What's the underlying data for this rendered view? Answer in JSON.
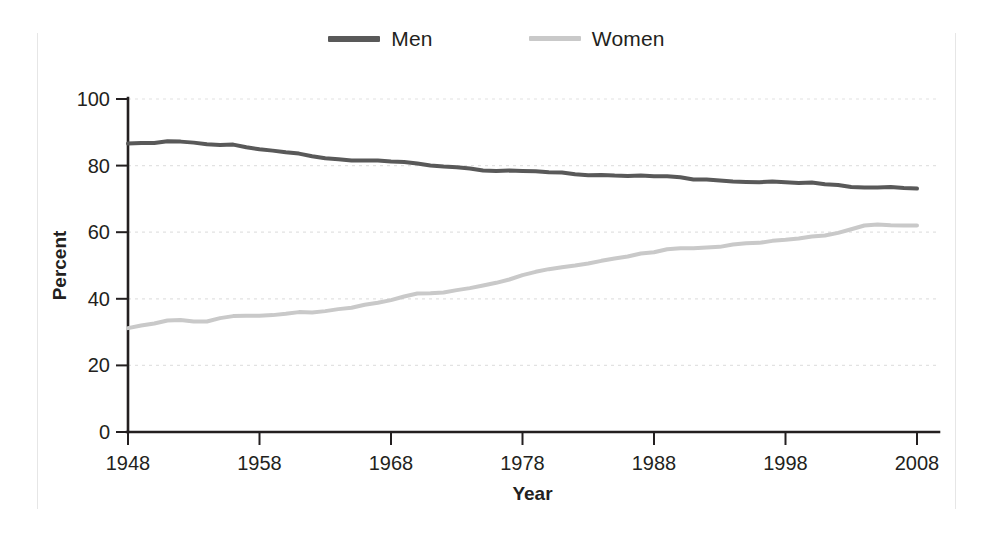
{
  "legend": {
    "position": "top-center",
    "entries": [
      {
        "label": "Men",
        "color": "#595959",
        "swatch": "men-line-swatch"
      },
      {
        "label": "Women",
        "color": "#c9c9c9",
        "swatch": "women-line-swatch"
      }
    ]
  },
  "chart_data": {
    "type": "line",
    "title": "",
    "subtitle": "",
    "xlabel": "Year",
    "ylabel": "Percent",
    "xlim": [
      1948,
      2008
    ],
    "ylim": [
      0,
      100
    ],
    "xticks": [
      1948,
      1958,
      1968,
      1978,
      1988,
      1998,
      2008
    ],
    "yticks": [
      0,
      20,
      40,
      60,
      80,
      100
    ],
    "grid": "horizontal-dotted",
    "legend_position": "top-center",
    "annotations": [],
    "x": [
      1948,
      1949,
      1950,
      1951,
      1952,
      1953,
      1954,
      1955,
      1956,
      1957,
      1958,
      1959,
      1960,
      1961,
      1962,
      1963,
      1964,
      1965,
      1966,
      1967,
      1968,
      1969,
      1970,
      1971,
      1972,
      1973,
      1974,
      1975,
      1976,
      1977,
      1978,
      1979,
      1980,
      1981,
      1982,
      1983,
      1984,
      1985,
      1986,
      1987,
      1988,
      1989,
      1990,
      1991,
      1992,
      1993,
      1994,
      1995,
      1996,
      1997,
      1998,
      1999,
      2000,
      2001,
      2002,
      2003,
      2004,
      2005,
      2006,
      2007,
      2008
    ],
    "series": [
      {
        "name": "Men",
        "color": "#595959",
        "width": 4.0,
        "values": [
          86.6,
          86.8,
          86.8,
          87.3,
          87.2,
          86.9,
          86.4,
          86.2,
          86.3,
          85.5,
          84.9,
          84.5,
          84.0,
          83.6,
          82.8,
          82.2,
          81.9,
          81.5,
          81.5,
          81.5,
          81.2,
          81.1,
          80.6,
          80.0,
          79.7,
          79.5,
          79.1,
          78.5,
          78.4,
          78.5,
          78.4,
          78.3,
          78.0,
          77.9,
          77.4,
          77.1,
          77.2,
          77.0,
          76.9,
          77.0,
          76.8,
          76.8,
          76.5,
          75.8,
          75.8,
          75.5,
          75.2,
          75.1,
          75.0,
          75.2,
          75.0,
          74.8,
          74.9,
          74.4,
          74.2,
          73.6,
          73.4,
          73.4,
          73.6,
          73.3,
          73.1
        ]
      },
      {
        "name": "Women",
        "color": "#c9c9c9",
        "width": 4.0,
        "values": [
          31.2,
          32.0,
          32.6,
          33.5,
          33.6,
          33.2,
          33.2,
          34.2,
          34.8,
          34.9,
          34.9,
          35.1,
          35.5,
          36.0,
          35.9,
          36.3,
          36.9,
          37.3,
          38.2,
          38.8,
          39.6,
          40.7,
          41.6,
          41.7,
          41.9,
          42.6,
          43.2,
          44.0,
          44.8,
          45.8,
          47.1,
          48.1,
          48.9,
          49.5,
          50.0,
          50.6,
          51.4,
          52.1,
          52.7,
          53.6,
          54.0,
          54.9,
          55.2,
          55.2,
          55.4,
          55.6,
          56.3,
          56.7,
          56.8,
          57.4,
          57.7,
          58.1,
          58.7,
          59.0,
          59.8,
          60.9,
          62.0,
          62.3,
          62.1,
          62.0,
          62.0
        ]
      }
    ]
  }
}
